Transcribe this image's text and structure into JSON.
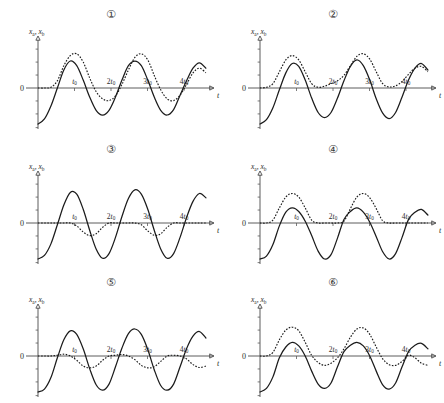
{
  "figure": {
    "background": "#ffffff",
    "ink": "#1b1b1b",
    "axis_color": "#4a4a4a",
    "columns": 2,
    "rows": 3
  },
  "axes": {
    "ylabel_a": "x",
    "ylabel_a_sub": "a",
    "ylabel_sep": ", ",
    "ylabel_b": "x",
    "ylabel_b_sub": "b",
    "xlabel": "t",
    "origin_label": "0",
    "tick_labels": [
      "t",
      "2t",
      "3t",
      "4t"
    ],
    "tick_subscript": "0",
    "tick_values": [
      1,
      2,
      3,
      4
    ],
    "xlim": [
      0,
      4.6
    ],
    "ylim": [
      -1.35,
      1.35
    ],
    "grid": false
  },
  "panels": [
    {
      "id": "panel-1",
      "number": "①",
      "number_plain": "1",
      "chart_data": {
        "type": "line",
        "title": "①",
        "xlabel": "t",
        "ylabel": "x_a, x_b",
        "xlim": [
          0,
          4.6
        ],
        "ylim": [
          -1.35,
          1.35
        ],
        "grid": false,
        "legend": null,
        "x_ticks": [
          1,
          2,
          3,
          4
        ],
        "x_tick_labels": [
          "t0",
          "2t0",
          "3t0",
          "4t0"
        ],
        "series": [
          {
            "name": "x_a",
            "style": "solid",
            "start_value": -1.0,
            "description": "rises from -1 at t=0, oscillates with period 2t0, amplitude ~0.75",
            "values": [
              -1.0,
              -0.86,
              -0.5,
              0.0,
              0.5,
              0.75,
              0.62,
              0.22,
              -0.25,
              -0.62,
              -0.75,
              -0.62,
              -0.25,
              0.22,
              0.62,
              0.75,
              0.62,
              0.22,
              -0.25,
              -0.62,
              -0.75,
              -0.6,
              -0.2,
              0.2,
              0.55,
              0.7,
              0.55
            ]
          },
          {
            "name": "x_b",
            "style": "dashed",
            "start_value": 0.0,
            "description": "starts flat near 0, alternating tall and short positive humps with negative lobes between",
            "values": [
              0.0,
              0.0,
              0.02,
              0.2,
              0.62,
              0.9,
              0.95,
              0.72,
              0.28,
              -0.1,
              -0.3,
              -0.35,
              -0.22,
              0.1,
              0.5,
              0.85,
              0.95,
              0.78,
              0.35,
              -0.05,
              -0.3,
              -0.35,
              -0.2,
              0.1,
              0.42,
              0.55,
              0.42
            ]
          }
        ]
      }
    },
    {
      "id": "panel-2",
      "number": "②",
      "number_plain": "2",
      "chart_data": {
        "type": "line",
        "title": "②",
        "xlabel": "t",
        "ylabel": "x_a, x_b",
        "xlim": [
          0,
          4.6
        ],
        "ylim": [
          -1.35,
          1.35
        ],
        "grid": false,
        "legend": null,
        "x_ticks": [
          1,
          2,
          3,
          4
        ],
        "x_tick_labels": [
          "t0",
          "2t0",
          "3t0",
          "4t0"
        ],
        "series": [
          {
            "name": "x_a",
            "style": "solid",
            "start_value": -1.0,
            "description": "rises from -1, oscillates with period 2t0 and slight amplitude modulation",
            "values": [
              -1.0,
              -0.88,
              -0.55,
              -0.05,
              0.42,
              0.68,
              0.6,
              0.22,
              -0.28,
              -0.68,
              -0.82,
              -0.68,
              -0.28,
              0.2,
              0.6,
              0.78,
              0.62,
              0.22,
              -0.3,
              -0.7,
              -0.85,
              -0.68,
              -0.25,
              0.22,
              0.55,
              0.68,
              0.5
            ]
          },
          {
            "name": "x_b",
            "style": "dashed",
            "start_value": 0.0,
            "description": "beating envelope: tall hump, small hump, tall hump, medium hump; stays mostly non-negative",
            "values": [
              0.0,
              0.02,
              0.12,
              0.45,
              0.78,
              0.9,
              0.78,
              0.45,
              0.12,
              0.02,
              0.05,
              0.12,
              0.2,
              0.35,
              0.62,
              0.88,
              0.95,
              0.8,
              0.45,
              0.12,
              0.03,
              0.06,
              0.18,
              0.38,
              0.55,
              0.6,
              0.45
            ]
          }
        ]
      }
    },
    {
      "id": "panel-3",
      "number": "③",
      "number_plain": "3",
      "chart_data": {
        "type": "line",
        "title": "③",
        "xlabel": "t",
        "ylabel": "x_a, x_b",
        "xlim": [
          0,
          4.6
        ],
        "ylim": [
          -1.35,
          1.35
        ],
        "grid": false,
        "legend": null,
        "x_ticks": [
          1,
          2,
          3,
          4
        ],
        "x_tick_labels": [
          "t0",
          "2t0",
          "3t0",
          "4t0"
        ],
        "series": [
          {
            "name": "x_a",
            "style": "solid",
            "start_value": -1.0,
            "description": "large amplitude oscillation rising from -1, period 2t0, amplitude ~0.95",
            "values": [
              -1.0,
              -0.9,
              -0.58,
              -0.05,
              0.5,
              0.85,
              0.8,
              0.38,
              -0.2,
              -0.72,
              -0.98,
              -0.85,
              -0.4,
              0.18,
              0.68,
              0.92,
              0.8,
              0.38,
              -0.2,
              -0.72,
              -0.98,
              -0.85,
              -0.4,
              0.15,
              0.6,
              0.82,
              0.7
            ]
          },
          {
            "name": "x_b",
            "style": "dashed",
            "start_value": 0.0,
            "description": "flat near zero except shallow negative lobes under the first and third positive solid humps",
            "values": [
              0.0,
              0.0,
              0.0,
              0.0,
              0.0,
              0.0,
              -0.08,
              -0.25,
              -0.35,
              -0.3,
              -0.12,
              0.0,
              0.0,
              0.0,
              0.0,
              0.0,
              -0.05,
              -0.22,
              -0.34,
              -0.3,
              -0.12,
              0.0,
              0.0,
              0.0,
              0.0,
              0.0,
              0.0
            ]
          }
        ]
      }
    },
    {
      "id": "panel-4",
      "number": "④",
      "number_plain": "4",
      "chart_data": {
        "type": "line",
        "title": "④",
        "xlabel": "t",
        "ylabel": "x_a, x_b",
        "xlim": [
          0,
          4.6
        ],
        "ylim": [
          -1.35,
          1.35
        ],
        "grid": false,
        "legend": null,
        "x_ticks": [
          1,
          2,
          3,
          4
        ],
        "x_tick_labels": [
          "t0",
          "2t0",
          "3t0",
          "4t0"
        ],
        "series": [
          {
            "name": "x_a",
            "style": "solid",
            "start_value": -1.0,
            "description": "full oscillation from -1, amplitude ~1.0, period 2t0, with small positive humps near t0 and 3t0",
            "values": [
              -1.0,
              -0.92,
              -0.6,
              -0.08,
              0.3,
              0.42,
              0.32,
              0.05,
              -0.35,
              -0.78,
              -1.0,
              -0.88,
              -0.42,
              0.1,
              0.32,
              0.42,
              0.3,
              0.02,
              -0.38,
              -0.8,
              -1.0,
              -0.85,
              -0.4,
              0.1,
              0.3,
              0.38,
              0.22
            ]
          },
          {
            "name": "x_b",
            "style": "dashed",
            "start_value": 0.0,
            "description": "positive-only humps centred on t0 and 3t0, flat at zero elsewhere",
            "values": [
              0.0,
              0.0,
              0.08,
              0.42,
              0.72,
              0.82,
              0.72,
              0.42,
              0.08,
              0.0,
              0.0,
              0.0,
              0.0,
              0.05,
              0.4,
              0.72,
              0.82,
              0.7,
              0.4,
              0.06,
              0.0,
              0.0,
              0.0,
              0.0,
              0.0,
              0.0,
              0.0
            ]
          }
        ]
      }
    },
    {
      "id": "panel-5",
      "number": "⑤",
      "number_plain": "5",
      "chart_data": {
        "type": "line",
        "title": "⑤",
        "xlabel": "t",
        "ylabel": "x_a, x_b",
        "xlim": [
          0,
          4.6
        ],
        "ylim": [
          -1.35,
          1.35
        ],
        "grid": false,
        "legend": null,
        "x_ticks": [
          1,
          2,
          3,
          4
        ],
        "x_tick_labels": [
          "t0",
          "2t0",
          "3t0",
          "4t0"
        ],
        "series": [
          {
            "name": "x_a",
            "style": "solid",
            "start_value": -1.0,
            "description": "rises from -1, oscillates with deeper negative troughs than positive crests",
            "values": [
              -1.0,
              -0.92,
              -0.6,
              -0.05,
              0.45,
              0.7,
              0.6,
              0.2,
              -0.35,
              -0.8,
              -0.95,
              -0.78,
              -0.3,
              0.22,
              0.62,
              0.75,
              0.6,
              0.18,
              -0.38,
              -0.82,
              -0.95,
              -0.78,
              -0.3,
              0.2,
              0.55,
              0.68,
              0.5
            ]
          },
          {
            "name": "x_b",
            "style": "dashed",
            "start_value": 0.0,
            "description": "starts flat at zero then shallow negative lobes repeating each period, amplitude ~0.3",
            "values": [
              0.0,
              0.0,
              0.0,
              0.02,
              0.05,
              0.0,
              -0.12,
              -0.28,
              -0.33,
              -0.28,
              -0.12,
              0.0,
              0.02,
              0.04,
              0.0,
              -0.1,
              -0.26,
              -0.33,
              -0.3,
              -0.15,
              0.0,
              0.02,
              0.0,
              -0.08,
              -0.24,
              -0.32,
              -0.28
            ]
          }
        ]
      }
    },
    {
      "id": "panel-6",
      "number": "⑥",
      "number_plain": "6",
      "chart_data": {
        "type": "line",
        "title": "⑥",
        "xlabel": "t",
        "ylabel": "x_a, x_b",
        "xlim": [
          0,
          4.6
        ],
        "ylim": [
          -1.35,
          1.35
        ],
        "grid": false,
        "legend": null,
        "x_ticks": [
          1,
          2,
          3,
          4
        ],
        "x_tick_labels": [
          "t0",
          "2t0",
          "3t0",
          "4t0"
        ],
        "series": [
          {
            "name": "x_a",
            "style": "solid",
            "start_value": -1.0,
            "description": "rises from -1, moderate positive crests and deeper negative troughs, period 2t0",
            "values": [
              -1.0,
              -0.9,
              -0.58,
              -0.05,
              0.25,
              0.38,
              0.28,
              0.0,
              -0.42,
              -0.78,
              -0.9,
              -0.75,
              -0.3,
              0.12,
              0.3,
              0.38,
              0.28,
              0.0,
              -0.42,
              -0.8,
              -0.92,
              -0.75,
              -0.3,
              0.12,
              0.3,
              0.35,
              0.2
            ]
          },
          {
            "name": "x_b",
            "style": "dashed",
            "start_value": 0.0,
            "description": "tall positive humps at t0 and 3t0 with shallow negative lobes at 2t0 and 4t0",
            "values": [
              0.0,
              0.0,
              0.1,
              0.45,
              0.72,
              0.8,
              0.7,
              0.38,
              0.02,
              -0.18,
              -0.26,
              -0.2,
              -0.05,
              0.2,
              0.52,
              0.75,
              0.78,
              0.6,
              0.25,
              -0.08,
              -0.24,
              -0.26,
              -0.15,
              0.02,
              -0.05,
              -0.2,
              -0.26
            ]
          }
        ]
      }
    }
  ]
}
